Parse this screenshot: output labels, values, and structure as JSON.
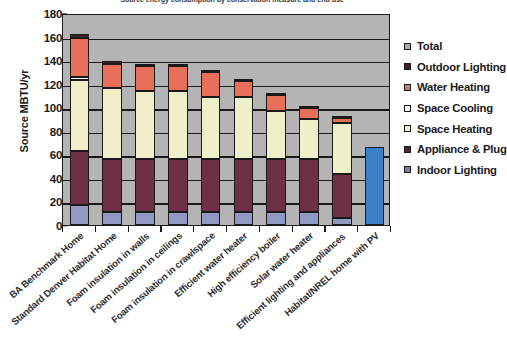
{
  "chart_data": {
    "type": "bar",
    "title": "Source energy consumption by conservation measure and end use",
    "xlabel": "",
    "ylabel": "Source MBTU/yr",
    "ylim": [
      0,
      180
    ],
    "ytick_step": 20,
    "yticks": [
      "180",
      "160",
      "140",
      "120",
      "100",
      "80",
      "60",
      "40",
      "20",
      "0"
    ],
    "grid": true,
    "stacked": true,
    "legend_position": "right",
    "categories": [
      "BA Benchmark Home",
      "Standard Denver Habitat Home",
      "Foam insulation in walls",
      "Foam insulation in ceilings",
      "Foam insulation in crawlspace",
      "Efficient water heater",
      "High efficiency boiler",
      "Solar water heater",
      "Efficient lighting and appliances",
      "Habitat/NREL home with PV"
    ],
    "series": [
      {
        "name": "Indoor Lighting",
        "color": "#9099c2",
        "values": [
          17,
          11,
          11,
          11,
          11,
          11,
          11,
          11,
          6,
          0
        ]
      },
      {
        "name": "Appliance & Plug",
        "color": "#6f2f46",
        "values": [
          46,
          45,
          45,
          45,
          45,
          45,
          45,
          45,
          37,
          0
        ]
      },
      {
        "name": "Space Heating",
        "color": "#eff0c9",
        "values": [
          60,
          60,
          58,
          58,
          53,
          53,
          41,
          34,
          44,
          0
        ]
      },
      {
        "name": "Space Cooling",
        "color": "#f2f2f2",
        "values": [
          3,
          0,
          0,
          0,
          0,
          0,
          0,
          0,
          0,
          0
        ]
      },
      {
        "name": "Water Heating",
        "color": "#e8705a",
        "values": [
          33,
          21,
          21,
          21,
          21,
          13,
          13,
          9,
          4,
          0
        ]
      },
      {
        "name": "Outdoor Lighting",
        "color": "#3c2222",
        "values": [
          3,
          2,
          2,
          2,
          2,
          2,
          2,
          2,
          1,
          0
        ]
      },
      {
        "name": "Total",
        "color": "#3a7fc8",
        "values": [
          0,
          0,
          0,
          0,
          0,
          0,
          0,
          0,
          0,
          66
        ]
      }
    ],
    "totals": [
      162,
      139,
      137,
      137,
      132,
      124,
      112,
      101,
      92,
      66
    ]
  },
  "legend": {
    "items": [
      {
        "label": "Total",
        "color": "#a9a9a9"
      },
      {
        "label": "Outdoor Lighting",
        "color": "#3c2222"
      },
      {
        "label": "Water Heating",
        "color": "#c4806e"
      },
      {
        "label": "Space Cooling",
        "color": "#f7f7f7"
      },
      {
        "label": "Space Heating",
        "color": "#eff0c9"
      },
      {
        "label": "Appliance & Plug",
        "color": "#4e2030"
      },
      {
        "label": "Indoor Lighting",
        "color": "#7b8199"
      }
    ]
  }
}
